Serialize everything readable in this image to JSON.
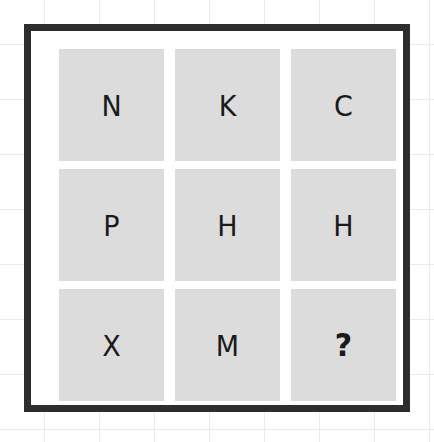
{
  "canvas": {
    "width": 434,
    "height": 442,
    "background_color": "#ffffff",
    "grid_line_color": "#e9e9ef",
    "grid_spacing_px": 55
  },
  "frame": {
    "border_color": "#2d2d2d",
    "border_width_px": 7,
    "inner_background": "#ffffff"
  },
  "puzzle": {
    "type": "3x3-letter-matrix",
    "rows": 3,
    "columns": 3,
    "tile_color": "#dcdcdc",
    "glyph_color": "#1a1a1a",
    "cells": [
      {
        "row": 1,
        "col": 1,
        "name": "cell-r1c1",
        "value": "N",
        "missing": false
      },
      {
        "row": 1,
        "col": 2,
        "name": "cell-r1c2",
        "value": "K",
        "missing": false
      },
      {
        "row": 1,
        "col": 3,
        "name": "cell-r1c3",
        "value": "C",
        "missing": false
      },
      {
        "row": 2,
        "col": 1,
        "name": "cell-r2c1",
        "value": "P",
        "missing": false
      },
      {
        "row": 2,
        "col": 2,
        "name": "cell-r2c2",
        "value": "H",
        "missing": false
      },
      {
        "row": 2,
        "col": 3,
        "name": "cell-r2c3",
        "value": "H",
        "missing": false
      },
      {
        "row": 3,
        "col": 1,
        "name": "cell-r3c1",
        "value": "X",
        "missing": false
      },
      {
        "row": 3,
        "col": 2,
        "name": "cell-r3c2",
        "value": "M",
        "missing": false
      },
      {
        "row": 3,
        "col": 3,
        "name": "cell-r3c3",
        "value": "?",
        "missing": true
      }
    ]
  }
}
